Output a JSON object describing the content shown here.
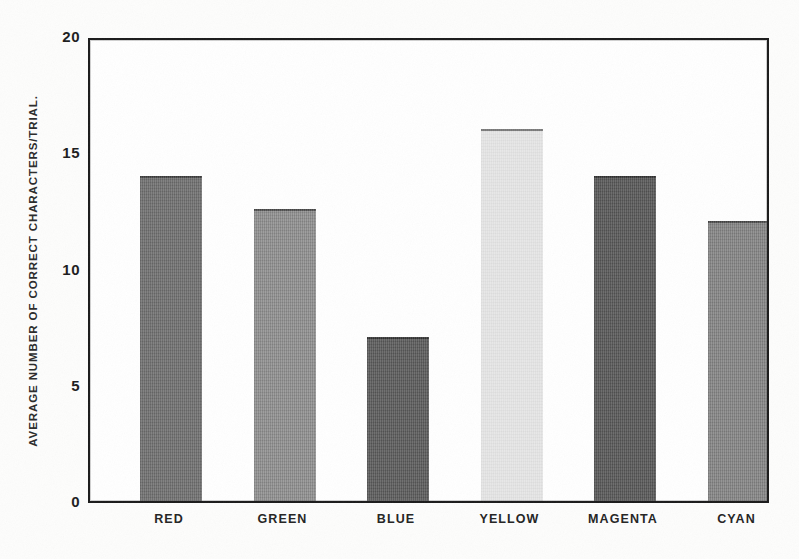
{
  "chart_data": {
    "type": "bar",
    "title": "",
    "xlabel": "",
    "ylabel": "AVERAGE NUMBER OF CORRECT CHARACTERS/TRIAL.",
    "categories": [
      "RED",
      "GREEN",
      "BLUE",
      "YELLOW",
      "MAGENTA",
      "CYAN"
    ],
    "values": [
      14.0,
      12.55,
      7.05,
      16.0,
      14.0,
      12.05
    ],
    "ylim": [
      0,
      20
    ],
    "yticks": [
      0,
      5,
      10,
      15,
      20
    ],
    "ytick_labels": [
      "0",
      "5",
      "10",
      "15",
      "20"
    ],
    "grid": false,
    "legend": null,
    "bar_fills": [
      "#6f6f6f",
      "#8f8f8f",
      "#5a5a5a",
      "#e6e6e6",
      "#565656",
      "#858585"
    ],
    "frame_color": "#1a1a1a",
    "background": "#ffffff"
  },
  "axis": {
    "y_title": "AVERAGE NUMBER OF CORRECT CHARACTERS/TRIAL.",
    "tick_labels": [
      "20",
      "15",
      "10",
      "5",
      "0"
    ]
  },
  "bars": [
    {
      "label": "RED",
      "value": 14.0,
      "fill": "#6f6f6f"
    },
    {
      "label": "GREEN",
      "value": 12.55,
      "fill": "#8f8f8f"
    },
    {
      "label": "BLUE",
      "value": 7.05,
      "fill": "#5a5a5a"
    },
    {
      "label": "YELLOW",
      "value": 16.0,
      "fill": "#e6e6e6"
    },
    {
      "label": "MAGENTA",
      "value": 14.0,
      "fill": "#565656"
    },
    {
      "label": "CYAN",
      "value": 12.05,
      "fill": "#858585"
    }
  ]
}
